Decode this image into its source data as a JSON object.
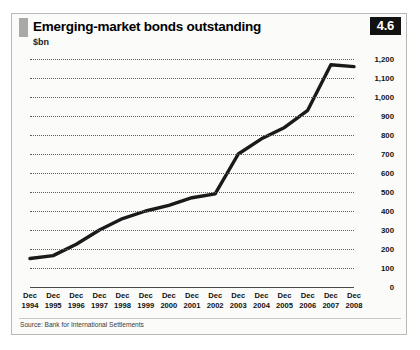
{
  "figure": {
    "number_badge": "4.6",
    "title": "Emerging-market bonds outstanding",
    "subtitle": "$bn",
    "source": "Source: Bank for International Settlements",
    "colors": {
      "line": "#1a1a1a",
      "grid": "#5d5d5d",
      "badge_background": "#121212",
      "badge_text": "#ffffff",
      "panel_background": "#fbfbfa",
      "border": "#b9b9b5",
      "title_tab": "#a9a9a6"
    }
  },
  "chart_data": {
    "type": "line",
    "title": "Emerging-market bonds outstanding",
    "subtitle": "$bn",
    "xlabel": "",
    "ylabel": "$bn",
    "ylim": [
      0,
      1200
    ],
    "ytick_step": 100,
    "grid": true,
    "grid_style": "dotted horizontal",
    "legend": "none",
    "source": "Source: Bank for International Settlements",
    "ytick_labels": [
      "0",
      "100",
      "200",
      "300",
      "400",
      "500",
      "600",
      "700",
      "800",
      "900",
      "1,000",
      "1,100",
      "1,200"
    ],
    "ytick_values": [
      0,
      100,
      200,
      300,
      400,
      500,
      600,
      700,
      800,
      900,
      1000,
      1100,
      1200
    ],
    "categories": [
      "Dec 1994",
      "Dec 1995",
      "Dec 1996",
      "Dec 1997",
      "Dec 1998",
      "Dec 1999",
      "Dec 2000",
      "Dec 2001",
      "Dec 2002",
      "Dec 2003",
      "Dec 2004",
      "Dec 2005",
      "Dec 2006",
      "Dec 2007",
      "Dec 2008"
    ],
    "xtick_labels": [
      [
        "Dec",
        "1994"
      ],
      [
        "Dec",
        "1995"
      ],
      [
        "Dec",
        "1996"
      ],
      [
        "Dec",
        "1997"
      ],
      [
        "Dec",
        "1998"
      ],
      [
        "Dec",
        "1999"
      ],
      [
        "Dec",
        "2000"
      ],
      [
        "Dec",
        "2001"
      ],
      [
        "Dec",
        "2002"
      ],
      [
        "Dec",
        "2003"
      ],
      [
        "Dec",
        "2004"
      ],
      [
        "Dec",
        "2005"
      ],
      [
        "Dec",
        "2006"
      ],
      [
        "Dec",
        "2007"
      ],
      [
        "Dec",
        "2008"
      ]
    ],
    "values": [
      150,
      165,
      225,
      300,
      360,
      400,
      430,
      470,
      490,
      700,
      780,
      840,
      930,
      1170,
      1160
    ],
    "series": [
      {
        "name": "Emerging-market bonds outstanding",
        "color": "#1a1a1a",
        "values": [
          150,
          165,
          225,
          300,
          360,
          400,
          430,
          470,
          490,
          700,
          780,
          840,
          930,
          1170,
          1160
        ]
      }
    ]
  }
}
